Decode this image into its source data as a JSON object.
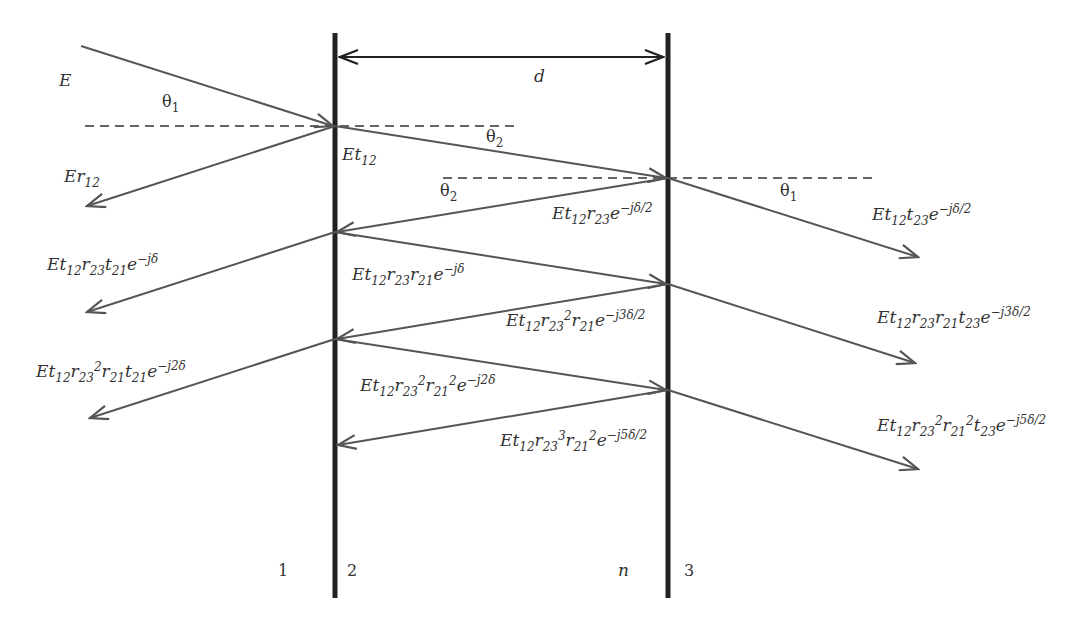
{
  "diagram": {
    "colors": {
      "plate": "#222222",
      "ray": "#555555",
      "text": "#333333",
      "dash": "#333333"
    },
    "thickness_label": "d",
    "regions": {
      "left_medium": "1",
      "interface_left": "2",
      "film_index": "n",
      "right_medium": "3"
    },
    "angles": {
      "incident": "θ1",
      "film_top": "θ2",
      "film_second": "θ2",
      "transmitted": "θ1"
    },
    "incident_label": "E",
    "reflected_labels": [
      "Er12",
      "Et12 r23 t21 e^-jδ",
      "Et12 r23^2 r21 t21 e^-j2δ"
    ],
    "internal_labels": [
      "Et12",
      "Et12 r23 e^-jδ/2",
      "Et12 r23 r21 e^-jδ",
      "Et12 r23^2 r21 e^-j3δ/2",
      "Et12 r23^2 r21^2 e^-j2δ",
      "Et12 r23^3 r21^2 e^-j5δ/2"
    ],
    "transmitted_labels": [
      "Et12 t23 e^-jδ/2",
      "Et12 r23 r21 t23 e^-j3δ/2",
      "Et12 r23^2 r21^2 t23 e^-j5δ/2"
    ]
  }
}
